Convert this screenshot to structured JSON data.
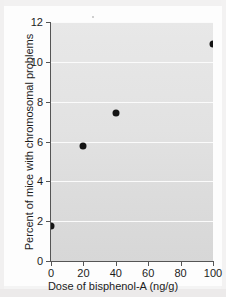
{
  "chart_data": {
    "type": "scatter",
    "title": "",
    "xlabel": "Dose of bisphenol-A (ng/g)",
    "ylabel": "Percent of mice with chromosomal problems",
    "xlim": [
      0,
      100
    ],
    "ylim": [
      0,
      12
    ],
    "xticks": [
      0,
      20,
      40,
      60,
      80,
      100
    ],
    "yticks": [
      0,
      2,
      4,
      6,
      8,
      10,
      12
    ],
    "xtick_labels": [
      "0",
      "20",
      "40",
      "60",
      "80",
      "100"
    ],
    "ytick_labels": [
      "0",
      "2",
      "4",
      "6",
      "8",
      "10",
      "12"
    ],
    "grid": "horizontal",
    "legend": null,
    "series": [
      {
        "name": "Percent of mice with chromosomal problems",
        "x": [
          0,
          20,
          40,
          100
        ],
        "y": [
          1.75,
          5.75,
          7.45,
          10.9
        ]
      }
    ],
    "points": [
      {
        "x": 0,
        "y": 1.75
      },
      {
        "x": 20,
        "y": 5.75
      },
      {
        "x": 40,
        "y": 7.45
      },
      {
        "x": 100,
        "y": 10.9
      }
    ],
    "marker_color": "#151515",
    "plot_background_color": "#e2e2e2",
    "gridline_color": "#fbfbfb",
    "axis_color": "#555555"
  }
}
